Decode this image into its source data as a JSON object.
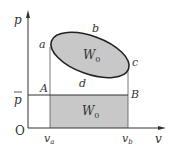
{
  "diagram": {
    "axes": {
      "y_label": "p",
      "x_label": "v",
      "origin_label": "O"
    },
    "points": {
      "a": "a",
      "b": "b",
      "c": "c",
      "d": "d",
      "A": "A",
      "B": "B"
    },
    "pressure_label": "p",
    "tick_labels": {
      "va_main": "v",
      "va_sub": "a",
      "vb_main": "v",
      "vb_sub": "b"
    },
    "areas": {
      "cycle_work_main": "W",
      "cycle_work_sub": "0",
      "rect_work_main": "W",
      "rect_work_sub": "0"
    },
    "colors": {
      "fill": "#c8c8c8",
      "line": "#333333"
    }
  }
}
